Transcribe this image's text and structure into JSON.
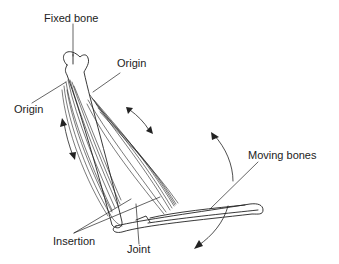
{
  "diagram": {
    "labels": {
      "fixed_bone": "Fixed bone",
      "origin_right": "Origin",
      "origin_left": "Origin",
      "moving_bones": "Moving bones",
      "insertion": "Insertion",
      "joint": "Joint"
    },
    "colors": {
      "line": "#222222",
      "background": "#ffffff"
    }
  }
}
